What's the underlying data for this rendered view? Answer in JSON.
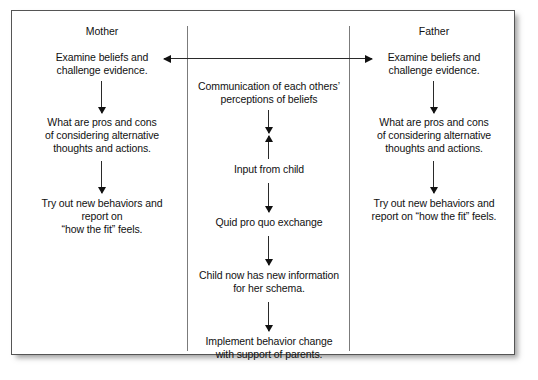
{
  "diagram": {
    "headers": {
      "mother": "Mother",
      "father": "Father"
    },
    "mother_column": {
      "steps": [
        "Examine beliefs and\nchallenge evidence.",
        "What are pros and cons\nof considering alternative\nthoughts and actions.",
        "Try out new behaviors and\nreport on\n“how the fit” feels."
      ]
    },
    "father_column": {
      "steps": [
        "Examine beliefs and\nchallenge evidence.",
        "What are pros and cons\nof considering alternative\nthoughts and actions.",
        "Try out new behaviors and\nreport on “how the fit” feels."
      ]
    },
    "center_column": {
      "steps": [
        "Communication of each others’\nperceptions of beliefs",
        "Input from child",
        "Quid pro quo exchange",
        "Child now has new information\nfor her schema.",
        "Implement behavior change\nwith support of parents."
      ]
    },
    "connectors": {
      "top_bidirectional": "double-headed horizontal arrow linking Mother and Father",
      "center_pair": "down arrow and up arrow between communication and input from child"
    },
    "colors": {
      "frame": "#555555",
      "divider": "#7b7b7b",
      "arrow": "#111111",
      "text": "#111111",
      "background": "#ffffff"
    }
  }
}
